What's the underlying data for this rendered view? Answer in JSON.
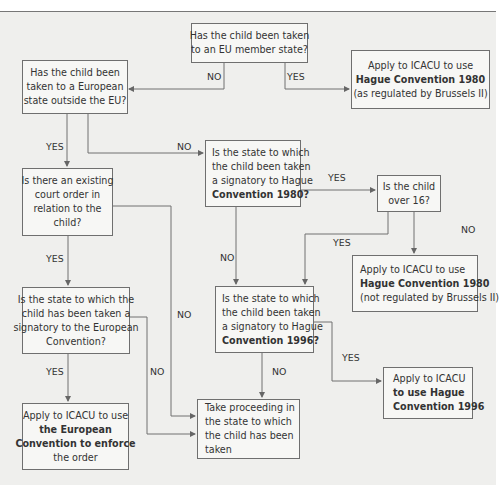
{
  "diagram": {
    "type": "flowchart",
    "nodes": {
      "eu_member": {
        "lines": [
          "Has the child been taken",
          "to an EU member state?"
        ]
      },
      "apply_1980_regulated": {
        "lines": [
          "Apply to ICACU to use",
          "Hague Convention 1980",
          "(as regulated by Brussels II)"
        ],
        "bold": [
          "Hague Convention 1980",
          "Brussels II"
        ]
      },
      "european_outside_eu": {
        "lines": [
          "Has the child been",
          "taken to a European",
          "state outside the EU?"
        ]
      },
      "signatory_1980": {
        "lines": [
          "Is the state to which",
          "the child been taken",
          "a signatory to Hague",
          "Convention 1980?"
        ]
      },
      "court_order": {
        "lines": [
          "Is there an existing",
          "court order in",
          "relation to the",
          "child?"
        ]
      },
      "over_16": {
        "lines": [
          "Is the child",
          "over 16?"
        ]
      },
      "apply_1980_not_regulated": {
        "lines": [
          "Apply to ICACU to use",
          "Hague Convention 1980",
          "(not regulated by Brussels II)"
        ]
      },
      "signatory_european": {
        "lines": [
          "Is the state to which the",
          "child has been taken a",
          "signatory to the European",
          "Convention?"
        ]
      },
      "signatory_1996": {
        "lines": [
          "Is the state to which",
          "the child been taken",
          "a signatory to Hague",
          "Convention 1996?"
        ]
      },
      "apply_1996": {
        "lines": [
          "Apply to ICACU",
          "to use Hague",
          "Convention 1996"
        ]
      },
      "apply_european": {
        "lines": [
          "Apply to ICACU to use",
          "the European",
          "Convention to enforce",
          "the order"
        ]
      },
      "take_proceeding": {
        "lines": [
          "Take proceeding in",
          "the state to which",
          "the child has been",
          "taken"
        ]
      }
    },
    "edges": [
      {
        "from": "eu_member",
        "to": "european_outside_eu",
        "label": "NO"
      },
      {
        "from": "eu_member",
        "to": "apply_1980_regulated",
        "label": "YES"
      },
      {
        "from": "european_outside_eu",
        "to": "court_order",
        "label": "YES"
      },
      {
        "from": "european_outside_eu",
        "to": "signatory_1980",
        "label": "NO"
      },
      {
        "from": "signatory_1980",
        "to": "over_16",
        "label": "YES"
      },
      {
        "from": "signatory_1980",
        "to": "signatory_1996",
        "label": "NO"
      },
      {
        "from": "over_16",
        "to": "signatory_1996",
        "label": "YES"
      },
      {
        "from": "over_16",
        "to": "apply_1980_not_regulated",
        "label": "NO"
      },
      {
        "from": "court_order",
        "to": "signatory_european",
        "label": "YES"
      },
      {
        "from": "court_order",
        "to": "take_proceeding",
        "label": "NO"
      },
      {
        "from": "signatory_european",
        "to": "apply_european",
        "label": "YES"
      },
      {
        "from": "signatory_european",
        "to": "take_proceeding",
        "label": "NO"
      },
      {
        "from": "signatory_1996",
        "to": "take_proceeding",
        "label": "NO"
      },
      {
        "from": "signatory_1996",
        "to": "apply_1996",
        "label": "YES"
      }
    ],
    "labels": {
      "no": "NO",
      "yes": "YES"
    }
  }
}
